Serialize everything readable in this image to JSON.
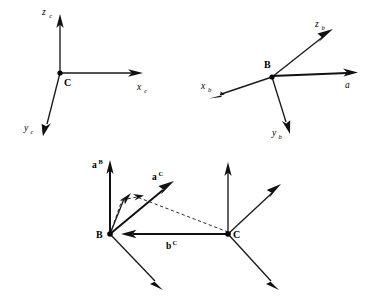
{
  "figure": {
    "background_color": "#ffffff",
    "stroke_color": "#111111",
    "panels": [
      {
        "id": "panel-frame-c",
        "name": "camera-frame-c",
        "origin_label": "C",
        "axes": [
          {
            "name": "z-axis",
            "label_base": "z",
            "label_sub": "c",
            "direction": "up"
          },
          {
            "name": "x-axis",
            "label_base": "x",
            "label_sub": "c",
            "direction": "right"
          },
          {
            "name": "y-axis",
            "label_base": "y",
            "label_sub": "c",
            "direction": "down-left"
          }
        ]
      },
      {
        "id": "panel-frame-b",
        "name": "body-frame-b",
        "origin_label": "B",
        "axes": [
          {
            "name": "z-axis",
            "label_base": "z",
            "label_sub": "b",
            "direction": "up-right"
          },
          {
            "name": "x-axis",
            "label_base": "x",
            "label_sub": "b",
            "direction": "down-left"
          },
          {
            "name": "y-axis",
            "label_base": "y",
            "label_sub": "b",
            "direction": "down"
          }
        ],
        "vectors": [
          {
            "name": "vector-a",
            "label": "a",
            "style": "italic",
            "direction": "right"
          }
        ]
      },
      {
        "id": "panel-transform",
        "name": "vector-transform-panel",
        "origins": [
          {
            "name": "origin-b",
            "label": "B"
          },
          {
            "name": "origin-c",
            "label": "C"
          }
        ],
        "vectors": [
          {
            "name": "vector-a-b",
            "label_base": "a",
            "label_sup": "B",
            "style": "bold"
          },
          {
            "name": "vector-a-c",
            "label_base": "a",
            "label_sup": "C",
            "style": "bold"
          },
          {
            "name": "vector-b-c",
            "label_base": "b",
            "label_sup": "C",
            "style": "bold"
          }
        ],
        "construction_lines": [
          {
            "name": "dashed-a-b-to-a-c",
            "style": "dashed"
          },
          {
            "name": "dashed-c-to-a-c",
            "style": "dashed"
          }
        ]
      }
    ]
  },
  "labels": {
    "z_c_base": "z",
    "z_c_sub": "c",
    "x_c_base": "x",
    "x_c_sub": "c",
    "y_c_base": "y",
    "y_c_sub": "c",
    "origin_c_top": "C",
    "z_b_base": "z",
    "z_b_sub": "b",
    "x_b_base": "x",
    "x_b_sub": "b",
    "y_b_base": "y",
    "y_b_sub": "b",
    "origin_b_top": "B",
    "vector_a": "a",
    "a_B_base": "a",
    "a_B_sup": "B",
    "a_C_base": "a",
    "a_C_sup": "C",
    "b_C_base": "b",
    "b_C_sup": "C",
    "origin_b_bottom": "B",
    "origin_c_bottom": "C"
  }
}
